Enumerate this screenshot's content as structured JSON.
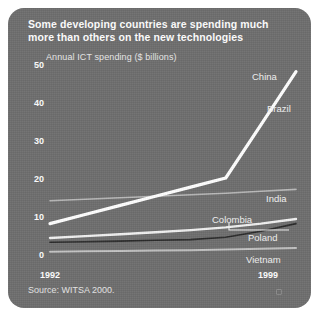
{
  "figure": {
    "title": "Some developing countries are spending much more than others on the new technologies",
    "source": "Source: WITSA 2000.",
    "background_color": "#6e6e6e",
    "text_color": "#ffffff"
  },
  "chart_data": {
    "type": "line",
    "title": "Some developing countries are spending much more than others on the new technologies",
    "subtitle": "Annual ICT spending ($ billions)",
    "xlabel": "",
    "ylabel": "Annual ICT spending ($ billions)",
    "x": [
      1992,
      1993,
      1994,
      1995,
      1996,
      1997,
      1998,
      1999
    ],
    "xtick_labels": [
      "1992",
      "1999"
    ],
    "xlim": [
      1992,
      1999
    ],
    "ylim": [
      0,
      50
    ],
    "ytick_labels": [
      "0",
      "10",
      "20",
      "30",
      "40",
      "50"
    ],
    "yticks": [
      0,
      10,
      20,
      30,
      40,
      50
    ],
    "grid": false,
    "legend": "inline-right-labels",
    "series": [
      {
        "name": "China",
        "color": "#ffffff",
        "width": 3.2,
        "values": [
          8,
          10.4,
          12.8,
          15.2,
          17.6,
          20,
          34,
          48
        ]
      },
      {
        "name": "Brazil",
        "color": "#ffffff",
        "width": 3.2,
        "values": [
          8,
          10.4,
          12.8,
          15.2,
          17.6,
          20,
          34,
          48
        ]
      },
      {
        "name": "India",
        "color": "#b9b9b9",
        "width": 1.6,
        "values": [
          14,
          14.4,
          14.8,
          15.2,
          15.6,
          16,
          16.5,
          17
        ]
      },
      {
        "name": "Colombia",
        "color": "#f0f0f0",
        "width": 2.4,
        "values": [
          4.2,
          4.7,
          5.2,
          5.7,
          6.3,
          7.0,
          8.0,
          9.2
        ]
      },
      {
        "name": "Poland",
        "color": "#2b2b2b",
        "width": 1.6,
        "values": [
          3.1,
          3.2,
          3.4,
          3.6,
          3.8,
          4.4,
          6.0,
          8.0
        ]
      },
      {
        "name": "Vietnam",
        "color": "#c2c2c2",
        "width": 2.0,
        "values": [
          0.6,
          0.7,
          0.8,
          0.9,
          1.0,
          1.2,
          1.4,
          1.6
        ]
      }
    ],
    "annotations": [
      {
        "name": "China",
        "label": "China"
      },
      {
        "name": "Brazil",
        "label": "Brazil"
      },
      {
        "name": "India",
        "label": "India"
      },
      {
        "name": "Colombia",
        "label": "Colombia"
      },
      {
        "name": "Poland",
        "label": "Poland"
      },
      {
        "name": "Vietnam",
        "label": "Vietnam"
      }
    ]
  },
  "axis": {
    "y_labels": [
      "50",
      "40",
      "30",
      "20",
      "10",
      "0"
    ],
    "x_start": "1992",
    "x_end": "1999"
  }
}
